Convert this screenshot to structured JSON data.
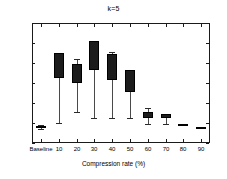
{
  "chart_data": {
    "type": "box",
    "title": "k=5",
    "xlabel": "Compression rate (%)",
    "ylabel": "",
    "ylim": [
      0.3,
      0.9
    ],
    "ytick_labels": [
      "0.3",
      "0.4",
      "0.5",
      "0.6",
      "0.7",
      "0.8",
      "0.9"
    ],
    "ytick_values": [
      0.3,
      0.4,
      0.5,
      0.6,
      0.7,
      0.8,
      0.9
    ],
    "grid": false,
    "legend": "none",
    "categories": [
      "Baseline",
      "10",
      "20",
      "30",
      "40",
      "50",
      "60",
      "70",
      "80",
      "90"
    ],
    "boxes": [
      {
        "category": "Baseline",
        "whisker_low": 0.37,
        "q1": 0.375,
        "median": 0.38,
        "q3": 0.386,
        "whisker_high": 0.392
      },
      {
        "category": "10",
        "whisker_low": 0.4,
        "q1": 0.625,
        "median": 0.7,
        "q3": 0.75,
        "whisker_high": 0.75
      },
      {
        "category": "20",
        "whisker_low": 0.455,
        "q1": 0.602,
        "median": 0.65,
        "q3": 0.697,
        "whisker_high": 0.722
      },
      {
        "category": "30",
        "whisker_low": 0.425,
        "q1": 0.665,
        "median": 0.74,
        "q3": 0.81,
        "whisker_high": 0.81
      },
      {
        "category": "40",
        "whisker_low": 0.425,
        "q1": 0.617,
        "median": 0.685,
        "q3": 0.745,
        "whisker_high": 0.755
      },
      {
        "category": "50",
        "whisker_low": 0.425,
        "q1": 0.556,
        "median": 0.61,
        "q3": 0.666,
        "whisker_high": 0.666
      },
      {
        "category": "60",
        "whisker_low": 0.393,
        "q1": 0.425,
        "median": 0.44,
        "q3": 0.455,
        "whisker_high": 0.475
      },
      {
        "category": "70",
        "whisker_low": 0.393,
        "q1": 0.425,
        "median": 0.435,
        "q3": 0.446,
        "whisker_high": 0.446
      },
      {
        "category": "80",
        "whisker_low": 0.383,
        "q1": 0.384,
        "median": 0.389,
        "q3": 0.396,
        "whisker_high": 0.396
      },
      {
        "category": "90",
        "whisker_low": 0.368,
        "q1": 0.37,
        "median": 0.375,
        "q3": 0.381,
        "whisker_high": 0.382
      }
    ]
  },
  "colors": {
    "box_fill": "#1c1c1c",
    "axis": "#1a1a1a",
    "whisker": "#4a4a4a",
    "background": "#ffffff",
    "text": "#000000"
  }
}
